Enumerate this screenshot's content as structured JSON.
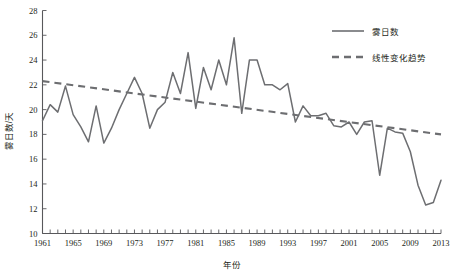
{
  "chart_data": {
    "type": "line",
    "title": "",
    "xlabel": "年份",
    "ylabel": "雾日数/天",
    "xlim": [
      1961,
      2013
    ],
    "ylim": [
      10,
      28
    ],
    "ytick_step": 2,
    "xtick_step": 1,
    "xtick_label_step": 4,
    "grid": false,
    "legend_position": "top-right",
    "yticks": [
      10,
      12,
      14,
      16,
      18,
      20,
      22,
      24,
      26,
      28
    ],
    "xticks": [
      1961,
      1965,
      1969,
      1973,
      1977,
      1981,
      1985,
      1989,
      1993,
      1997,
      2001,
      2005,
      2009,
      2013
    ],
    "x": [
      1961,
      1962,
      1963,
      1964,
      1965,
      1966,
      1967,
      1968,
      1969,
      1970,
      1971,
      1972,
      1973,
      1974,
      1975,
      1976,
      1977,
      1978,
      1979,
      1980,
      1981,
      1982,
      1983,
      1984,
      1985,
      1986,
      1987,
      1988,
      1989,
      1990,
      1991,
      1992,
      1993,
      1994,
      1995,
      1996,
      1997,
      1998,
      1999,
      2000,
      2001,
      2002,
      2003,
      2004,
      2005,
      2006,
      2007,
      2008,
      2009,
      2010,
      2011,
      2012,
      2013
    ],
    "series": [
      {
        "name": "雾日数",
        "style": "solid",
        "color": "#6d6e71",
        "values": [
          19.1,
          20.4,
          19.8,
          21.9,
          19.6,
          18.6,
          17.4,
          20.3,
          17.3,
          18.5,
          20.0,
          21.3,
          22.6,
          21.3,
          18.5,
          20.0,
          20.6,
          23.0,
          21.3,
          24.6,
          20.1,
          23.4,
          21.6,
          24.0,
          22.0,
          25.8,
          19.7,
          24.0,
          24.0,
          22.0,
          22.0,
          21.6,
          22.1,
          19.0,
          20.3,
          19.5,
          19.5,
          19.7,
          18.7,
          18.6,
          19.0,
          18.0,
          19.0,
          19.1,
          14.7,
          18.5,
          18.2,
          18.1,
          16.6,
          13.9,
          12.3,
          12.5,
          14.3
        ]
      },
      {
        "name": "线性变化趋势",
        "style": "dashed",
        "color": "#6d6e71",
        "endpoints": [
          [
            1961,
            22.3
          ],
          [
            2013,
            18.0
          ]
        ]
      }
    ],
    "legend": [
      {
        "label": "雾日数",
        "style": "solid"
      },
      {
        "label": "线性变化趋势",
        "style": "dashed"
      }
    ]
  }
}
